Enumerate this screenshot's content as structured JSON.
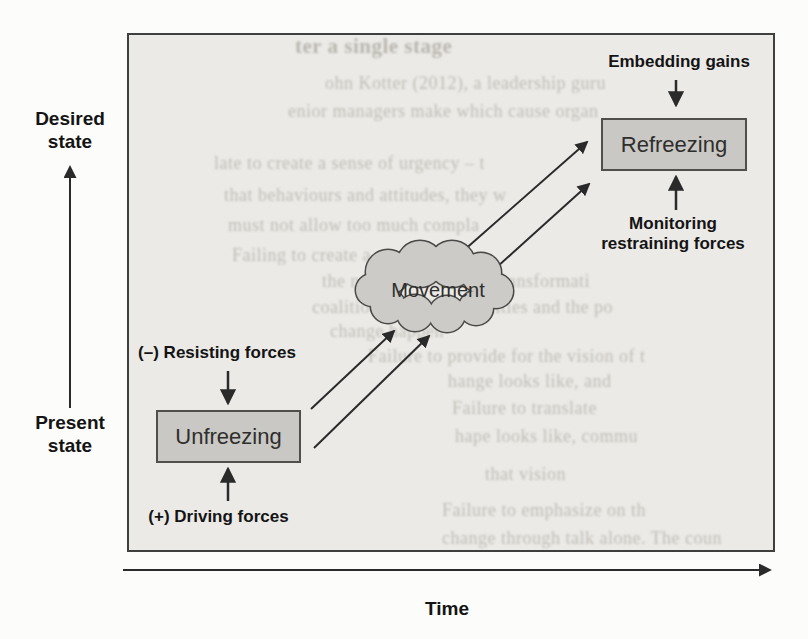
{
  "labels": {
    "desired_state": {
      "line1": "Desired",
      "line2": "state"
    },
    "present_state": {
      "line1": "Present",
      "line2": "state"
    },
    "time_axis": "Time",
    "resisting_forces": "(–) Resisting forces",
    "driving_forces": "(+) Driving forces",
    "embedding_gains": "Embedding gains",
    "monitoring": {
      "line1": "Monitoring",
      "line2": "restraining forces"
    }
  },
  "stages": {
    "unfreezing": "Unfreezing",
    "movement": "Movement",
    "refreezing": "Refreezing"
  },
  "colors": {
    "page_bg": "#fcfcfa",
    "frame_bg": "#ebeae7",
    "frame_border": "#3f3f3d",
    "box_fill": "#c9c8c5",
    "box_border": "#504f4b",
    "cloud_fill": "#cccbc8",
    "arrow": "#2a2a2a",
    "text": "#141414",
    "bleed_text": "#b9b5ad"
  },
  "bleedthrough": [
    {
      "text": "ter a single stage"
    },
    {
      "text": "ohn Kotter (2012), a leadership guru"
    },
    {
      "text": "enior managers make which cause organ"
    },
    {
      "text": "late to create a sense of urgency – t"
    },
    {
      "text": "that behaviours and attitudes, they w"
    },
    {
      "text": "must not allow too much compla"
    },
    {
      "text": "Failing to create a powerful gu"
    },
    {
      "text": "the need for and drive transformati"
    },
    {
      "text": "coalition with the capacities and the po"
    },
    {
      "text": "change happen"
    },
    {
      "text": "Failure to provide for the vision of t"
    },
    {
      "text": "hange looks like, and"
    },
    {
      "text": "Failure to translate"
    },
    {
      "text": "hape looks like, commu"
    },
    {
      "text": "that vision"
    },
    {
      "text": "Failure to emphasize on th"
    },
    {
      "text": "change through talk alone. The coun"
    }
  ]
}
